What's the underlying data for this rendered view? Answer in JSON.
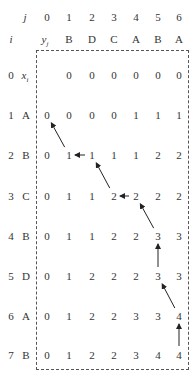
{
  "header": {
    "j_label": "j",
    "i_label": "i",
    "y_label": "y",
    "y_sub": "j",
    "x_label": "x",
    "x_sub": "i",
    "j_indices": [
      "0",
      "1",
      "2",
      "3",
      "4",
      "5",
      "6"
    ],
    "y_sequence": [
      "B",
      "D",
      "C",
      "A",
      "B",
      "A"
    ]
  },
  "rows": [
    {
      "i": "0",
      "x": "",
      "cells": [
        "",
        "0",
        "0",
        "0",
        "0",
        "0",
        "0"
      ]
    },
    {
      "i": "1",
      "x": "A",
      "cells": [
        "0",
        "0",
        "0",
        "0",
        "1",
        "1",
        "1"
      ]
    },
    {
      "i": "2",
      "x": "B",
      "cells": [
        "0",
        "1",
        "1",
        "1",
        "1",
        "2",
        "2"
      ]
    },
    {
      "i": "3",
      "x": "C",
      "cells": [
        "0",
        "1",
        "1",
        "2",
        "2",
        "2",
        "2"
      ]
    },
    {
      "i": "4",
      "x": "B",
      "cells": [
        "0",
        "1",
        "1",
        "2",
        "2",
        "3",
        "3"
      ]
    },
    {
      "i": "5",
      "x": "D",
      "cells": [
        "0",
        "1",
        "2",
        "2",
        "2",
        "3",
        "3"
      ]
    },
    {
      "i": "6",
      "x": "A",
      "cells": [
        "0",
        "1",
        "2",
        "2",
        "3",
        "3",
        "4"
      ]
    },
    {
      "i": "7",
      "x": "B",
      "cells": [
        "0",
        "1",
        "2",
        "2",
        "3",
        "4",
        "4"
      ]
    }
  ],
  "arrows": [
    {
      "from": [
        2,
        1
      ],
      "to": [
        1,
        0
      ],
      "dir": "up-left"
    },
    {
      "from": [
        2,
        2
      ],
      "to": [
        2,
        1
      ],
      "dir": "left"
    },
    {
      "from": [
        3,
        3
      ],
      "to": [
        2,
        2
      ],
      "dir": "up-left"
    },
    {
      "from": [
        3,
        4
      ],
      "to": [
        3,
        3
      ],
      "dir": "left"
    },
    {
      "from": [
        4,
        5
      ],
      "to": [
        3,
        4
      ],
      "dir": "up-left"
    },
    {
      "from": [
        5,
        5
      ],
      "to": [
        4,
        5
      ],
      "dir": "up"
    },
    {
      "from": [
        6,
        6
      ],
      "to": [
        5,
        5
      ],
      "dir": "up-left"
    },
    {
      "from": [
        7,
        6
      ],
      "to": [
        6,
        6
      ],
      "dir": "up"
    }
  ],
  "colors": {
    "text": "#333333",
    "arrow": "#222222",
    "border": "#555555"
  }
}
